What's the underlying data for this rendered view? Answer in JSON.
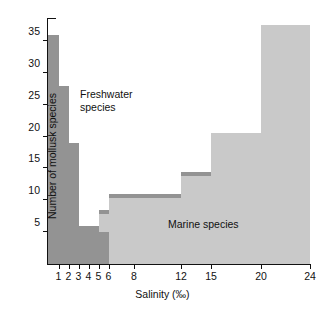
{
  "chart_data": {
    "type": "bar",
    "title": "",
    "xlabel": "Salinity (‰)",
    "ylabel": "Number of mollusk species",
    "xlim": [
      0,
      24
    ],
    "ylim": [
      0,
      38
    ],
    "grid": false,
    "legend_position": "inline-annotations",
    "x_tick_labels": [
      "1",
      "2",
      "3",
      "4",
      "5",
      "6",
      "8",
      "12",
      "15",
      "20",
      "24"
    ],
    "x_tick_values": [
      1,
      2,
      3,
      4,
      5,
      6,
      8,
      12,
      15,
      20,
      24
    ],
    "y_tick_labels": [
      "5",
      "10",
      "15",
      "20",
      "25",
      "30",
      "35"
    ],
    "y_tick_values": [
      5,
      10,
      15,
      20,
      25,
      30,
      35
    ],
    "annotations": [
      {
        "name": "freshwater",
        "text": "Freshwater\nspecies",
        "color": "#939393"
      },
      {
        "name": "marine",
        "text": "Marine species",
        "color": "#c9c9c9"
      }
    ],
    "series": [
      {
        "name": "Freshwater species",
        "color": "#939393",
        "bins": [
          {
            "x0": 0,
            "x1": 1,
            "value": 36
          },
          {
            "x0": 1,
            "x1": 2,
            "value": 28
          },
          {
            "x0": 2,
            "x1": 3,
            "value": 19
          },
          {
            "x0": 3,
            "x1": 5,
            "value": 6
          },
          {
            "x0": 5,
            "x1": 6,
            "value": 5
          }
        ]
      },
      {
        "name": "Marine species",
        "color": "#c9c9c9",
        "bins": [
          {
            "x0": 0,
            "x1": 5,
            "value": 2
          },
          {
            "x0": 5,
            "x1": 6,
            "value": 8.5
          },
          {
            "x0": 6,
            "x1": 12,
            "value": 11
          },
          {
            "x0": 12,
            "x1": 15,
            "value": 14.5
          },
          {
            "x0": 15,
            "x1": 20,
            "value": 20.5
          },
          {
            "x0": 20,
            "x1": 24,
            "value": 37.5
          }
        ]
      }
    ]
  }
}
